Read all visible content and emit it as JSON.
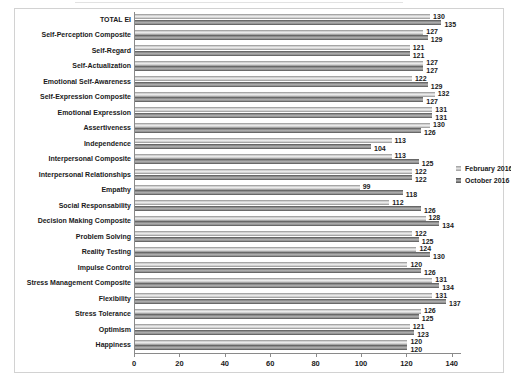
{
  "chart_data": {
    "type": "bar",
    "orientation": "horizontal",
    "title": "",
    "categories": [
      "TOTAL EI",
      "Self-Perception Composite",
      "Self-Regard",
      "Self-Actualization",
      "Emotional Self-Awareness",
      "Self-Expression Composite",
      "Emotional Expression",
      "Assertiveness",
      "Independence",
      "Interpersonal Composite",
      "Interpersonal Relationships",
      "Empathy",
      "Social Responsability",
      "Decision Making Composite",
      "Problem Solving",
      "Reality Testing",
      "Impulse Control",
      "Stress Management Composite",
      "Flexibility",
      "Stress Tolerance",
      "Optimism",
      "Happiness"
    ],
    "series": [
      {
        "name": "February 2016",
        "color": "#c9c9c9",
        "values": [
          130,
          127,
          121,
          127,
          122,
          132,
          131,
          130,
          113,
          113,
          122,
          99,
          112,
          128,
          122,
          124,
          120,
          131,
          131,
          126,
          121,
          120
        ]
      },
      {
        "name": "October 2016",
        "color": "#7a7a7a",
        "values": [
          135,
          129,
          121,
          127,
          129,
          127,
          131,
          126,
          104,
          125,
          122,
          118,
          126,
          134,
          125,
          130,
          126,
          134,
          137,
          125,
          123,
          120
        ]
      }
    ],
    "xlim": [
      0,
      140
    ],
    "xticks": [
      "0",
      "20",
      "40",
      "60",
      "80",
      "100",
      "120",
      "140"
    ],
    "x_axis_values": [
      0,
      20,
      40,
      60,
      80,
      100,
      120,
      140
    ],
    "legend_position": "right",
    "grid": false,
    "data_labels": true
  }
}
